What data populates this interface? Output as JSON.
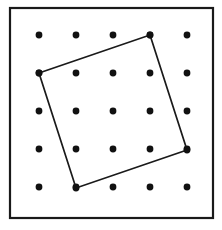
{
  "figure": {
    "background_color": "#ffffff",
    "ink_color": "#1a1a1a"
  },
  "board": {
    "frame": {
      "x": 10,
      "y": 8,
      "width": 203,
      "height": 210,
      "stroke_color": "#1a1a1a",
      "stroke_width": 2.2,
      "fill_color": "#ffffff"
    },
    "grid": {
      "rows": 5,
      "columns": 5,
      "origin_x": 39,
      "origin_y": 35,
      "spacing_x": 37,
      "spacing_y": 38,
      "dot_radius": 3.4,
      "dot_color": "#111111"
    }
  },
  "shape": {
    "name": "tilted-square",
    "stroke_color": "#1a1a1a",
    "stroke_width": 1.7,
    "fill": "none",
    "vertices": [
      {
        "label": "top",
        "grid_col": 3,
        "grid_row": 0,
        "x": 150,
        "y": 35
      },
      {
        "label": "right",
        "grid_col": 4,
        "grid_row": 3,
        "x": 187,
        "y": 150
      },
      {
        "label": "bottom",
        "grid_col": 1,
        "grid_row": 4,
        "x": 76,
        "y": 188
      },
      {
        "label": "left",
        "grid_col": 0,
        "grid_row": 1,
        "x": 39,
        "y": 73
      }
    ],
    "points_string": "150,35 187,150 76,188 39,73"
  },
  "chart_data": {
    "type": "scatter",
    "xlabel": "",
    "ylabel": "",
    "xlim": [
      0,
      4
    ],
    "ylim": [
      0,
      4
    ],
    "grid": false,
    "legend": "none",
    "series": [
      {
        "name": "lattice points",
        "marker": "filled-circle",
        "x": [
          0,
          1,
          2,
          3,
          4,
          0,
          1,
          2,
          3,
          4,
          0,
          1,
          2,
          3,
          4,
          0,
          1,
          2,
          3,
          4,
          0,
          1,
          2,
          3,
          4
        ],
        "y": [
          0,
          0,
          0,
          0,
          0,
          1,
          1,
          1,
          1,
          1,
          2,
          2,
          2,
          2,
          2,
          3,
          3,
          3,
          3,
          3,
          4,
          4,
          4,
          4,
          4
        ]
      },
      {
        "name": "tilted square outline",
        "marker": "none",
        "closed": true,
        "x": [
          3,
          4,
          1,
          0
        ],
        "y": [
          0,
          3,
          4,
          1
        ]
      }
    ],
    "annotations": []
  }
}
